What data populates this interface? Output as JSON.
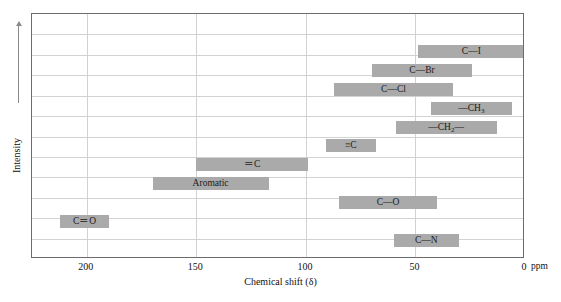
{
  "chart_data": {
    "type": "bar",
    "title": "",
    "subtitle": "",
    "xlabel": "Chemical shift (δ)",
    "ylabel": "Intensity",
    "xunit": "ppm",
    "xlim": [
      225,
      0
    ],
    "x_axis_reversed": true,
    "grid": true,
    "legend_position": "none",
    "xticks": [
      {
        "value": 200,
        "label": "200"
      },
      {
        "value": 150,
        "label": "150"
      },
      {
        "value": 100,
        "label": "100"
      },
      {
        "value": 50,
        "label": "50"
      },
      {
        "value": 0,
        "label": "0"
      }
    ],
    "hgridline_count": 11,
    "bar_color": "#aaaaaa",
    "frame_color": "#6b6b6b",
    "grid_color": "#d2d2d2",
    "ranges": [
      {
        "label": "C—I",
        "plain": "C-I",
        "start_ppm": 49,
        "end_ppm": 0,
        "row": 2
      },
      {
        "label": "C—Br",
        "plain": "C-Br",
        "start_ppm": 70,
        "end_ppm": 24,
        "row": 3
      },
      {
        "label": "C—Cl",
        "plain": "C-Cl",
        "start_ppm": 87,
        "end_ppm": 33,
        "row": 4
      },
      {
        "label": "—CH₃",
        "plain": "-CH3",
        "start_ppm": 43,
        "end_ppm": 6,
        "row": 5
      },
      {
        "label": "—CH₂—",
        "plain": "-CH2-",
        "start_ppm": 59,
        "end_ppm": 13,
        "row": 6
      },
      {
        "label": "≡C",
        "plain": "alkyne C",
        "start_ppm": 91,
        "end_ppm": 68,
        "row": 7
      },
      {
        "label": "＝C",
        "plain": "alkene C",
        "start_ppm": 150,
        "end_ppm": 99,
        "row": 8
      },
      {
        "label": "Aromatic",
        "plain": "Aromatic",
        "start_ppm": 170,
        "end_ppm": 117,
        "row": 9
      },
      {
        "label": "C—O",
        "plain": "C-O",
        "start_ppm": 85,
        "end_ppm": 40,
        "row": 10
      },
      {
        "label": "C＝O",
        "plain": "C=O",
        "start_ppm": 212,
        "end_ppm": 190,
        "row": 11
      },
      {
        "label": "C—N",
        "plain": "C-N",
        "start_ppm": 60,
        "end_ppm": 30,
        "row": 12
      }
    ]
  },
  "axis": {
    "ppm_unit_label": "ppm",
    "x_title": "Chemical shift (δ)",
    "y_title": "Intensity"
  }
}
